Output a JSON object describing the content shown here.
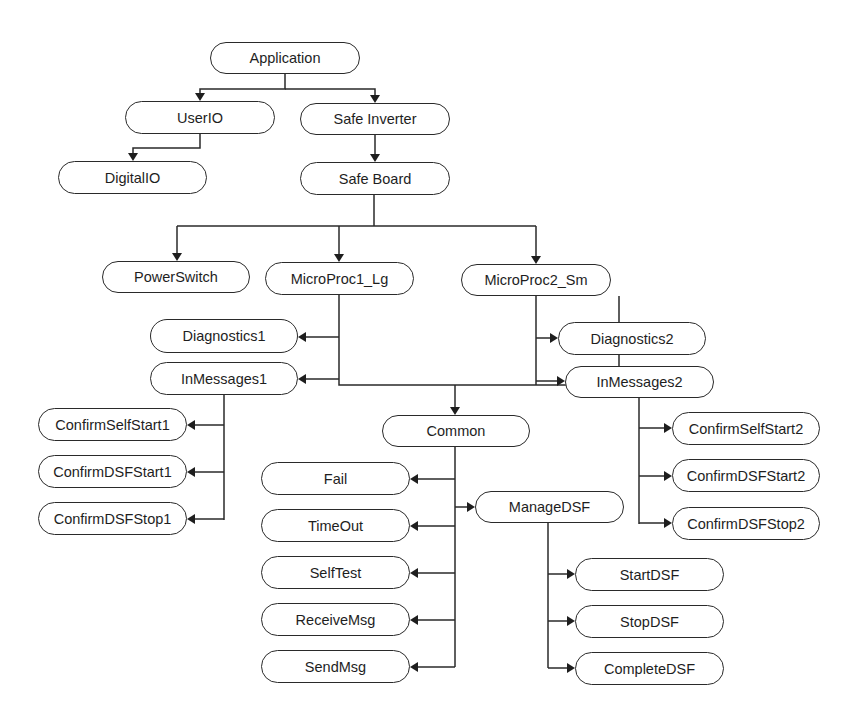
{
  "diagram": {
    "type": "hierarchy-tree",
    "colors": {
      "line": "#2a2a2a",
      "text": "#1e1e1e",
      "background": "#ffffff"
    },
    "nodes": [
      {
        "id": "application",
        "label": "Application",
        "x": 210,
        "y": 42,
        "w": 150,
        "h": 32
      },
      {
        "id": "userio",
        "label": "UserIO",
        "x": 125,
        "y": 101,
        "w": 150,
        "h": 33
      },
      {
        "id": "safe-inverter",
        "label": "Safe Inverter",
        "x": 300,
        "y": 103,
        "w": 150,
        "h": 32
      },
      {
        "id": "digitalio",
        "label": "DigitalIO",
        "x": 58,
        "y": 161,
        "w": 149,
        "h": 33
      },
      {
        "id": "safe-board",
        "label": "Safe Board",
        "x": 300,
        "y": 162,
        "w": 150,
        "h": 33
      },
      {
        "id": "powerswitch",
        "label": "PowerSwitch",
        "x": 102,
        "y": 261,
        "w": 148,
        "h": 32
      },
      {
        "id": "microproc1-lg",
        "label": "MicroProc1_Lg",
        "x": 265,
        "y": 262,
        "w": 149,
        "h": 33
      },
      {
        "id": "microproc2-sm",
        "label": "MicroProc2_Sm",
        "x": 461,
        "y": 264,
        "w": 150,
        "h": 32
      },
      {
        "id": "diagnostics1",
        "label": "Diagnostics1",
        "x": 150,
        "y": 319,
        "w": 148,
        "h": 34
      },
      {
        "id": "inmessages1",
        "label": "InMessages1",
        "x": 150,
        "y": 362,
        "w": 148,
        "h": 33
      },
      {
        "id": "diagnostics2",
        "label": "Diagnostics2",
        "x": 558,
        "y": 322,
        "w": 148,
        "h": 33
      },
      {
        "id": "inmessages2",
        "label": "InMessages2",
        "x": 565,
        "y": 366,
        "w": 149,
        "h": 32
      },
      {
        "id": "common",
        "label": "Common",
        "x": 382,
        "y": 415,
        "w": 148,
        "h": 32
      },
      {
        "id": "confirmselfstart1",
        "label": "ConfirmSelfStart1",
        "x": 38,
        "y": 408,
        "w": 149,
        "h": 33
      },
      {
        "id": "confirmdsfstart1",
        "label": "ConfirmDSFStart1",
        "x": 38,
        "y": 455,
        "w": 149,
        "h": 33
      },
      {
        "id": "confirmdsfstop1",
        "label": "ConfirmDSFStop1",
        "x": 38,
        "y": 502,
        "w": 149,
        "h": 33
      },
      {
        "id": "confirmselfstart2",
        "label": "ConfirmSelfStart2",
        "x": 672,
        "y": 412,
        "w": 148,
        "h": 33
      },
      {
        "id": "confirmdsfstart2",
        "label": "ConfirmDSFStart2",
        "x": 672,
        "y": 459,
        "w": 148,
        "h": 33
      },
      {
        "id": "confirmdsfstop2",
        "label": "ConfirmDSFStop2",
        "x": 672,
        "y": 507,
        "w": 148,
        "h": 33
      },
      {
        "id": "fail",
        "label": "Fail",
        "x": 261,
        "y": 462,
        "w": 149,
        "h": 33
      },
      {
        "id": "timeout",
        "label": "TimeOut",
        "x": 261,
        "y": 509,
        "w": 149,
        "h": 33
      },
      {
        "id": "selftest",
        "label": "SelfTest",
        "x": 261,
        "y": 556,
        "w": 149,
        "h": 33
      },
      {
        "id": "receivemsg",
        "label": "ReceiveMsg",
        "x": 261,
        "y": 603,
        "w": 149,
        "h": 33
      },
      {
        "id": "sendmsg",
        "label": "SendMsg",
        "x": 261,
        "y": 650,
        "w": 149,
        "h": 33
      },
      {
        "id": "managedsf",
        "label": "ManageDSF",
        "x": 475,
        "y": 491,
        "w": 149,
        "h": 32
      },
      {
        "id": "startdsf",
        "label": "StartDSF",
        "x": 575,
        "y": 558,
        "w": 149,
        "h": 33
      },
      {
        "id": "stopdsf",
        "label": "StopDSF",
        "x": 575,
        "y": 605,
        "w": 149,
        "h": 33
      },
      {
        "id": "completedsf",
        "label": "CompleteDSF",
        "x": 575,
        "y": 652,
        "w": 149,
        "h": 33
      }
    ],
    "edges": [
      {
        "from": "application",
        "to": "userio"
      },
      {
        "from": "application",
        "to": "safe-inverter"
      },
      {
        "from": "userio",
        "to": "digitalio"
      },
      {
        "from": "safe-inverter",
        "to": "safe-board"
      },
      {
        "from": "safe-board",
        "to": "powerswitch"
      },
      {
        "from": "safe-board",
        "to": "microproc1-lg"
      },
      {
        "from": "safe-board",
        "to": "microproc2-sm"
      },
      {
        "from": "microproc1-lg",
        "to": "diagnostics1"
      },
      {
        "from": "microproc1-lg",
        "to": "inmessages1"
      },
      {
        "from": "microproc1-lg",
        "to": "common"
      },
      {
        "from": "microproc2-sm",
        "to": "diagnostics2"
      },
      {
        "from": "microproc2-sm",
        "to": "inmessages2"
      },
      {
        "from": "microproc2-sm",
        "to": "common"
      },
      {
        "from": "inmessages1",
        "to": "confirmselfstart1"
      },
      {
        "from": "inmessages1",
        "to": "confirmdsfstart1"
      },
      {
        "from": "inmessages1",
        "to": "confirmdsfstop1"
      },
      {
        "from": "inmessages2",
        "to": "confirmselfstart2"
      },
      {
        "from": "inmessages2",
        "to": "confirmdsfstart2"
      },
      {
        "from": "inmessages2",
        "to": "confirmdsfstop2"
      },
      {
        "from": "common",
        "to": "fail"
      },
      {
        "from": "common",
        "to": "timeout"
      },
      {
        "from": "common",
        "to": "selftest"
      },
      {
        "from": "common",
        "to": "receivemsg"
      },
      {
        "from": "common",
        "to": "sendmsg"
      },
      {
        "from": "common",
        "to": "managedsf"
      },
      {
        "from": "managedsf",
        "to": "startdsf"
      },
      {
        "from": "managedsf",
        "to": "stopdsf"
      },
      {
        "from": "managedsf",
        "to": "completedsf"
      }
    ]
  }
}
